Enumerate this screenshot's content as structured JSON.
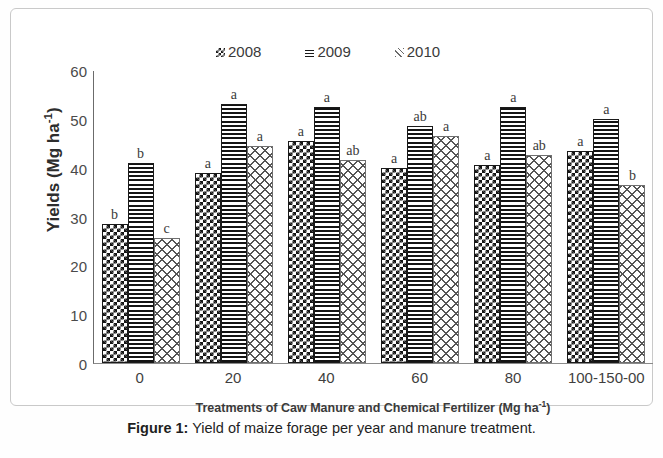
{
  "figure": {
    "caption_label": "Figure 1:",
    "caption_text": " Yield of maize forage per year and manure treatment."
  },
  "legend": {
    "position": "top-center",
    "items": [
      {
        "label": "2008",
        "pattern": "checkerboard",
        "color": "#141414"
      },
      {
        "label": "2009",
        "pattern": "horizontal-stripes",
        "color": "#141414"
      },
      {
        "label": "2010",
        "pattern": "diagonal-crosshatch",
        "color": "#555555"
      }
    ]
  },
  "axes": {
    "y_title_main": "Yields (Mg ha",
    "y_title_sup": "-1",
    "y_title_close": ")",
    "x_title_main": "Treatments of Caw Manure and Chemical Fertilizer (Mg ha",
    "x_title_sup": "-1",
    "x_title_close": ")"
  },
  "chart_data": {
    "type": "bar",
    "title": "",
    "xlabel": "Treatments of Caw Manure and Chemical Fertilizer (Mg ha-1)",
    "ylabel": "Yields (Mg ha-1)",
    "ylim": [
      0,
      60
    ],
    "yticks": [
      0,
      10,
      20,
      30,
      40,
      50,
      60
    ],
    "grid": false,
    "legend_position": "top-center",
    "categories": [
      "0",
      "20",
      "40",
      "60",
      "80",
      "100-150-00"
    ],
    "series": [
      {
        "name": "2008",
        "values": [
          28.5,
          39.0,
          45.5,
          40.0,
          40.5,
          43.5
        ],
        "labels": [
          "b",
          "a",
          "a",
          "a",
          "a",
          "a"
        ]
      },
      {
        "name": "2009",
        "values": [
          41.0,
          53.0,
          52.5,
          48.5,
          52.5,
          50.0
        ],
        "labels": [
          "b",
          "a",
          "a",
          "ab",
          "a",
          "a"
        ]
      },
      {
        "name": "2010",
        "values": [
          25.5,
          44.5,
          41.5,
          46.5,
          42.5,
          36.5
        ],
        "labels": [
          "c",
          "a",
          "ab",
          "a",
          "ab",
          "b"
        ]
      }
    ]
  }
}
